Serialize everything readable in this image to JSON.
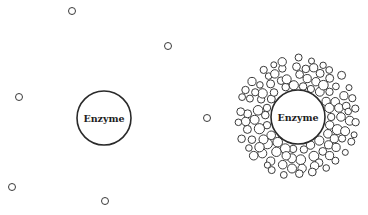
{
  "diagram": {
    "type": "enzyme-substrate-concentration-comparison",
    "colors": {
      "stroke": "#2a2a2a",
      "substrate_stroke": "#3a3a3a",
      "background": "#ffffff"
    },
    "panels": [
      {
        "id": "low-concentration",
        "enzyme": {
          "label": "Enzyme",
          "cx": 104,
          "cy": 118,
          "r": 27
        },
        "substrates": [
          {
            "cx": 72,
            "cy": 11,
            "r": 3.5
          },
          {
            "cx": 168,
            "cy": 46,
            "r": 3.5
          },
          {
            "cx": 19,
            "cy": 97,
            "r": 3.5
          },
          {
            "cx": 12,
            "cy": 187,
            "r": 3.5
          },
          {
            "cx": 105,
            "cy": 201,
            "r": 3.5
          },
          {
            "cx": 207,
            "cy": 118,
            "r": 3.5
          }
        ]
      },
      {
        "id": "high-concentration",
        "enzyme": {
          "label": "Enzyme",
          "cx": 298,
          "cy": 117,
          "r": 27
        },
        "substrate_cloud": {
          "center": [
            298,
            117
          ],
          "rings": [
            {
              "radius": 33,
              "count": 22,
              "r": 4.2,
              "offset": 0.0
            },
            {
              "radius": 42,
              "count": 27,
              "r": 4.4,
              "offset": 0.12
            },
            {
              "radius": 51,
              "count": 32,
              "r": 4.0,
              "offset": 0.05
            },
            {
              "radius": 59,
              "count": 30,
              "r": 3.6,
              "offset": 0.18
            }
          ]
        }
      }
    ]
  }
}
